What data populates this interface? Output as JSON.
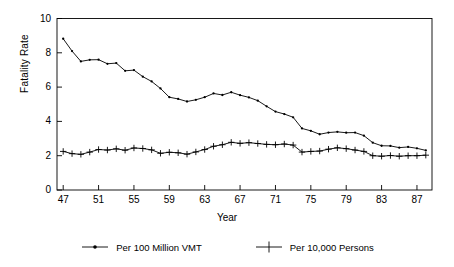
{
  "chart_data": {
    "type": "line",
    "title": "",
    "xlabel": "Year",
    "ylabel": "Fatality Rate",
    "xlim": [
      46.3,
      88.7
    ],
    "ylim": [
      0,
      10
    ],
    "grid": false,
    "legend_position": "bottom",
    "xticks": [
      47,
      51,
      55,
      59,
      63,
      67,
      71,
      75,
      79,
      83,
      87
    ],
    "xtick_labels": [
      "47",
      "51",
      "55",
      "59",
      "63",
      "67",
      "71",
      "75",
      "79",
      "83",
      "87"
    ],
    "yticks": [
      0,
      2,
      4,
      6,
      8,
      10
    ],
    "ytick_labels": [
      "0",
      "2",
      "4",
      "6",
      "8",
      "10"
    ],
    "x": [
      47,
      48,
      49,
      50,
      51,
      52,
      53,
      54,
      55,
      56,
      57,
      58,
      59,
      60,
      61,
      62,
      63,
      64,
      65,
      66,
      67,
      68,
      69,
      70,
      71,
      72,
      73,
      74,
      75,
      76,
      77,
      78,
      79,
      80,
      81,
      82,
      83,
      84,
      85,
      86,
      87,
      88
    ],
    "series": [
      {
        "name": "Per 100 Million VMT",
        "marker": "dot",
        "color": "#000000",
        "values": [
          8.82,
          8.1,
          7.5,
          7.59,
          7.6,
          7.36,
          7.4,
          6.95,
          6.99,
          6.61,
          6.33,
          5.92,
          5.41,
          5.31,
          5.16,
          5.26,
          5.41,
          5.63,
          5.54,
          5.7,
          5.53,
          5.4,
          5.21,
          4.88,
          4.57,
          4.43,
          4.24,
          3.59,
          3.45,
          3.25,
          3.35,
          3.39,
          3.34,
          3.35,
          3.17,
          2.76,
          2.58,
          2.57,
          2.47,
          2.51,
          2.43,
          2.31
        ]
      },
      {
        "name": "Per 10,000 Persons",
        "marker": "plus",
        "color": "#000000",
        "values": [
          2.25,
          2.12,
          2.08,
          2.21,
          2.36,
          2.33,
          2.4,
          2.32,
          2.45,
          2.42,
          2.34,
          2.14,
          2.2,
          2.17,
          2.09,
          2.22,
          2.36,
          2.55,
          2.64,
          2.78,
          2.72,
          2.76,
          2.71,
          2.66,
          2.64,
          2.68,
          2.62,
          2.21,
          2.25,
          2.27,
          2.38,
          2.46,
          2.41,
          2.33,
          2.25,
          2.0,
          1.97,
          2.01,
          1.97,
          2.0,
          2.0,
          2.03
        ]
      }
    ]
  }
}
